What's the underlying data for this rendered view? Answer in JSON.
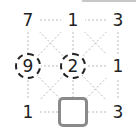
{
  "puzzle": {
    "grid": [
      [
        "7",
        "1",
        "3"
      ],
      [
        "9",
        "2",
        "1"
      ],
      [
        "1",
        "",
        "3"
      ]
    ],
    "circled": [
      "9",
      "2"
    ],
    "empty_cell": {
      "row": 2,
      "col": 1
    },
    "cells": {
      "r0c0": "7",
      "r0c1": "1",
      "r0c2": "3",
      "r1c0": "9",
      "r1c1": "2",
      "r1c2": "1",
      "r2c0": "1",
      "r2c2": "3"
    }
  },
  "colors": {
    "text": "#222222",
    "dotted_line": "#bbbbbb",
    "empty_cell_border": "#8a8a8a",
    "topbar": "#c8c8c8"
  }
}
